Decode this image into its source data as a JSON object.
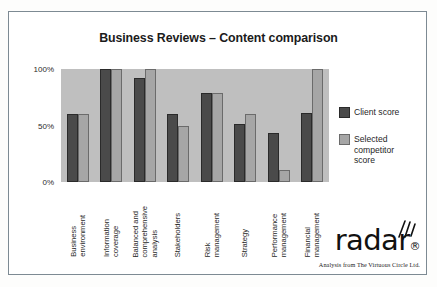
{
  "chart_data": {
    "type": "bar",
    "title": "Business Reviews – Content comparison",
    "xlabel": "",
    "ylabel": "",
    "ylim": [
      0,
      100
    ],
    "yticks": [
      "0%",
      "50%",
      "100%"
    ],
    "ytick_values": [
      0,
      50,
      100
    ],
    "grid": false,
    "legend_position": "right",
    "categories": [
      "Business environment",
      "Information coverage",
      "Balanced and comprehensive analysis",
      "Stakeholders",
      "Risk management",
      "Strategy",
      "Performance management",
      "Financial management"
    ],
    "category_lines": [
      [
        "Business",
        "environment"
      ],
      [
        "Information",
        "coverage"
      ],
      [
        "Balanced and",
        "comprehensive",
        "analysis"
      ],
      [
        "Stakeholders"
      ],
      [
        "Risk",
        "management"
      ],
      [
        "Strategy"
      ],
      [
        "Performance",
        "management"
      ],
      [
        "Financial",
        "management"
      ]
    ],
    "series": [
      {
        "name": "Client score",
        "color": "#4a4a4a",
        "values": [
          60,
          100,
          92,
          60,
          79,
          51,
          43,
          61
        ]
      },
      {
        "name": "Selected competitor score",
        "color": "#a6a6a6",
        "values": [
          60,
          100,
          100,
          50,
          79,
          60,
          11,
          100
        ]
      }
    ]
  },
  "legend": {
    "items": [
      {
        "label": "Client score",
        "swatch": "client"
      },
      {
        "label": "Selected\ncompetitor\nscore",
        "swatch": "competitor"
      }
    ]
  },
  "logo": {
    "wordmark": "radar",
    "registered_mark": "®",
    "tagline": "Analysis from The Virtuous Circle Ltd."
  },
  "colors": {
    "plot_background": "#bfbfbf",
    "client_bar": "#4a4a4a",
    "competitor_bar": "#a6a6a6",
    "frame_border": "#7d8a93",
    "text": "#1f1f1f"
  }
}
